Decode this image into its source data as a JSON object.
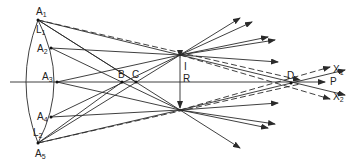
{
  "diagram": {
    "type": "ray-optics",
    "colors": {
      "line": "#2a2a2a",
      "background": "#ffffff"
    },
    "labels": {
      "A1": {
        "main": "A",
        "sub": "1"
      },
      "L1": {
        "main": "L",
        "sub": "1"
      },
      "A2": {
        "main": "A",
        "sub": "2"
      },
      "A3": {
        "main": "A",
        "sub": "3"
      },
      "A4": {
        "main": "A",
        "sub": "4"
      },
      "L2": {
        "main": "L",
        "sub": "2"
      },
      "A5": {
        "main": "A",
        "sub": "5"
      },
      "B": {
        "main": "B"
      },
      "C": {
        "main": "C"
      },
      "I": {
        "main": "I"
      },
      "R": {
        "main": "R"
      },
      "D": {
        "main": "D"
      },
      "P": {
        "main": "P"
      },
      "X1": {
        "main": "X",
        "sub": "1"
      },
      "X2": {
        "main": "X",
        "sub": "2"
      }
    }
  }
}
